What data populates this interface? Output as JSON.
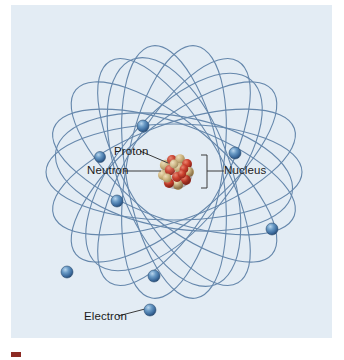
{
  "figure": {
    "kind": "atomic-structure-diagram",
    "panel_background": "#e3ecf4",
    "page_background": "#ffffff"
  },
  "labels": {
    "proton": "Proton",
    "neutron": "Neutron",
    "nucleus": "Nucleus",
    "electron": "Electron"
  },
  "caption": {
    "swatch_color": "#8d2b24",
    "text": ""
  },
  "colors": {
    "orbit_stroke": "#5b7fa6",
    "electron_fill": "#3f6f9f",
    "electron_highlight": "#9ec4e2",
    "electron_rim": "#2d5076",
    "proton_red": "#c8372b",
    "neutron_tan": "#d9c08a",
    "leader_line": "#3a3a3a",
    "label_text": "#1b1b1b"
  },
  "diagram_data": {
    "type": "scientific-illustration",
    "title": "Atomic structure: nucleus with orbiting electrons",
    "nucleus": {
      "center": [
        176,
        167
      ],
      "radius": 16,
      "particle_counts": {
        "protons": 13,
        "neutrons": 14
      },
      "description": "Dense cluster of red protons and tan neutrons"
    },
    "electrons": [
      {
        "id": "e1",
        "x": 143,
        "y": 121,
        "r": 6
      },
      {
        "id": "e2",
        "x": 100,
        "y": 152,
        "r": 5.5
      },
      {
        "id": "e3",
        "x": 117,
        "y": 196,
        "r": 6
      },
      {
        "id": "e4",
        "x": 66,
        "y": 267,
        "r": 6
      },
      {
        "id": "e5",
        "x": 154,
        "y": 271,
        "r": 6
      },
      {
        "id": "e6",
        "x": 150,
        "y": 307,
        "r": 6
      },
      {
        "id": "e7",
        "x": 235,
        "y": 148,
        "r": 6
      },
      {
        "id": "e8",
        "x": 272,
        "y": 224,
        "r": 6
      }
    ],
    "orbits": {
      "count": 9,
      "shape": "ellipse",
      "semi_major_axis": 128,
      "semi_minor_axis": 48,
      "center": [
        176,
        167
      ],
      "rotation_step_degrees": 20,
      "stroke_width": 1.1,
      "note": "Overlapping ellipses rotated about the nucleus"
    },
    "leaders": [
      {
        "label": "proton",
        "from": [
          140,
          147
        ],
        "to": [
          170,
          160
        ]
      },
      {
        "label": "neutron",
        "from": [
          124,
          166
        ],
        "to": [
          163,
          166
        ]
      },
      {
        "label": "nucleus",
        "from": [
          211,
          166
        ],
        "to": [
          196,
          166
        ],
        "bracket": true
      },
      {
        "label": "electron",
        "from": [
          118,
          311
        ],
        "to": [
          146,
          305
        ]
      }
    ]
  }
}
